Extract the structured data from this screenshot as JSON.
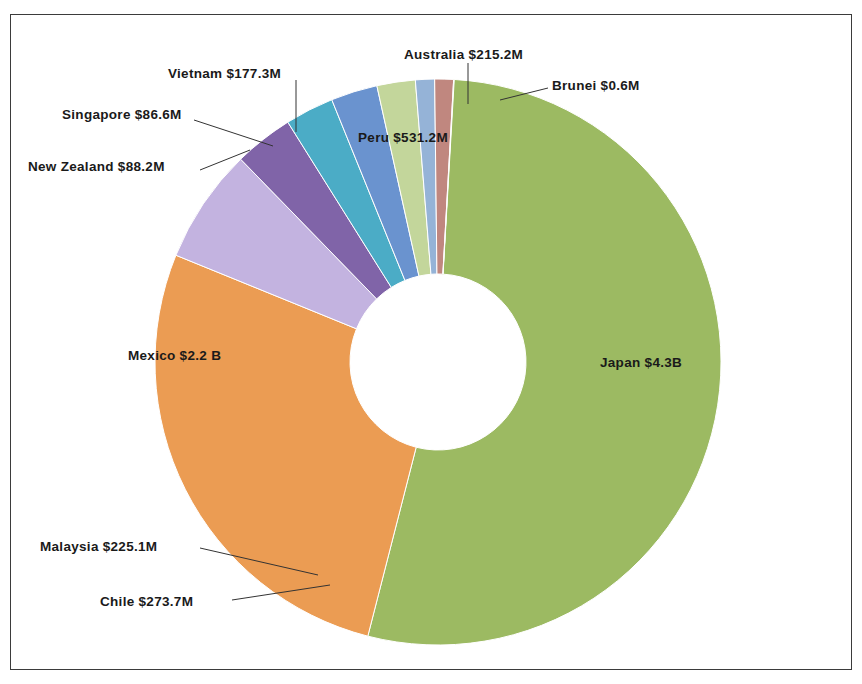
{
  "chart_title": "",
  "chart_data": {
    "type": "pie",
    "variant": "doughnut",
    "title": "",
    "xlabel": "",
    "ylabel": "",
    "units": "USD",
    "legend": "none",
    "grid": false,
    "labels_inside": [
      "Japan",
      "Mexico",
      "Peru"
    ],
    "categories": [
      "Japan",
      "Mexico",
      "Peru",
      "Chile",
      "Malaysia",
      "Australia",
      "Vietnam",
      "New Zealand",
      "Singapore",
      "Brunei"
    ],
    "values": [
      4300,
      2200,
      531.2,
      273.7,
      225.1,
      215.2,
      177.3,
      88.2,
      86.6,
      0.6
    ],
    "value_unit": "millions",
    "slices": [
      {
        "name": "Japan",
        "label": "Japan $4.3B",
        "value": 4300,
        "display_value": "$4.3B",
        "color": "#9cba62",
        "label_pos": "inside"
      },
      {
        "name": "Mexico",
        "label": "Mexico $2.2 B",
        "value": 2200,
        "display_value": "$2.2 B",
        "color": "#eb9c53",
        "label_pos": "inside"
      },
      {
        "name": "Peru",
        "label": "Peru $531.2M",
        "value": 531.2,
        "display_value": "$531.2M",
        "color": "#c3b3e0",
        "label_pos": "inside"
      },
      {
        "name": "Chile",
        "label": "Chile $273.7M",
        "value": 273.7,
        "display_value": "$273.7M",
        "color": "#8064a8",
        "label_pos": "outside"
      },
      {
        "name": "Malaysia",
        "label": "Malaysia $225.1M",
        "value": 225.1,
        "display_value": "$225.1M",
        "color": "#4bacc6",
        "label_pos": "outside"
      },
      {
        "name": "Australia",
        "label": "Australia $215.2M",
        "value": 215.2,
        "display_value": "$215.2M",
        "color": "#6a93cf",
        "label_pos": "outside"
      },
      {
        "name": "Vietnam",
        "label": "Vietnam $177.3M",
        "value": 177.3,
        "display_value": "$177.3M",
        "color": "#c3d69b",
        "label_pos": "outside"
      },
      {
        "name": "New Zealand",
        "label": "New Zealand $88.2M",
        "value": 88.2,
        "display_value": "$88.2M",
        "color": "#95b3d7",
        "label_pos": "outside"
      },
      {
        "name": "Singapore",
        "label": "Singapore $86.6M",
        "value": 86.6,
        "display_value": "$86.6M",
        "color": "#c0877f",
        "label_pos": "outside"
      },
      {
        "name": "Brunei",
        "label": "Brunei $0.6M",
        "value": 0.6,
        "display_value": "$0.6M",
        "color": "#9cba62",
        "label_pos": "outside"
      }
    ]
  }
}
